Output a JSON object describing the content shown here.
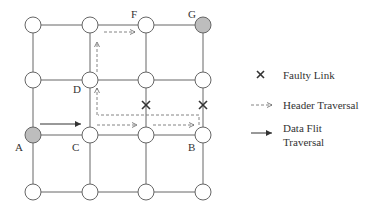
{
  "diagram": {
    "type": "mesh-network-routing",
    "grid": {
      "columns": 4,
      "rows": 4
    },
    "node_labels": {
      "A": "A",
      "B": "B",
      "C": "C",
      "D": "D",
      "F": "F",
      "G": "G"
    },
    "highlighted_nodes": [
      "A",
      "G"
    ],
    "faulty_links": [
      "between row2 and row3 at column 3",
      "between row2 and row3 at column 4"
    ],
    "colors": {
      "node_fill": "#ffffff",
      "highlighted_fill": "#bdbdbd",
      "line": "#555555",
      "fault_mark": "#333333"
    }
  },
  "legend": {
    "faulty_link": "Faulty Link",
    "header_traversal": "Header Traversal",
    "data_flit_line1": "Data Flit",
    "data_flit_line2": "Traversal"
  }
}
